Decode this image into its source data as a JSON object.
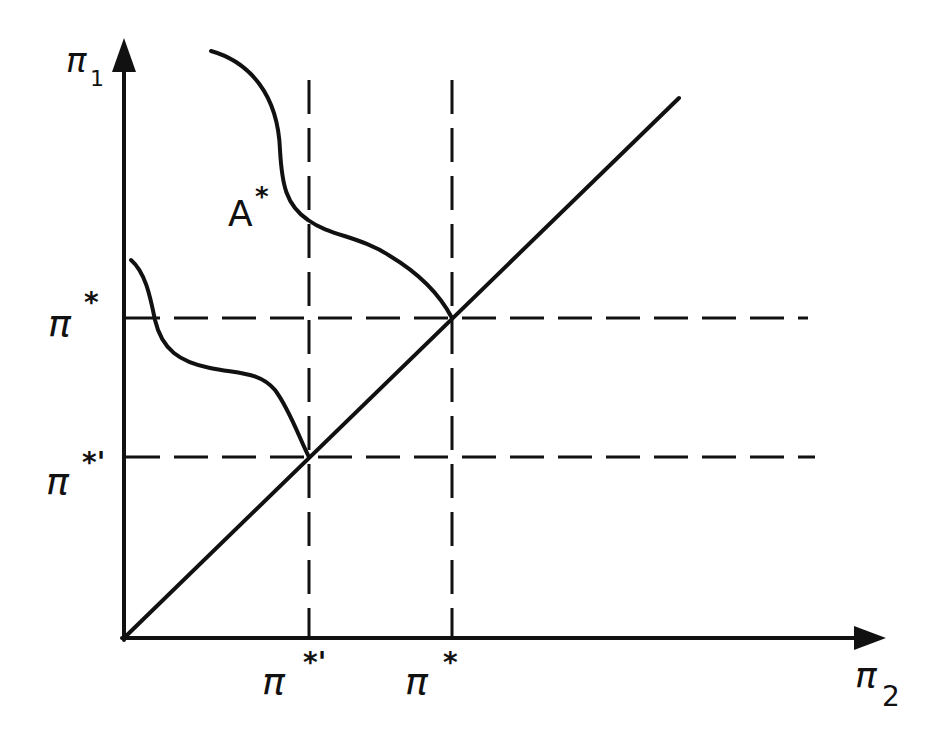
{
  "diagram": {
    "colors": {
      "ink": "#111111",
      "background": "#ffffff"
    },
    "axes": {
      "x": {
        "symbol": "π",
        "subscript": "2"
      },
      "y": {
        "symbol": "π",
        "subscript": "1"
      }
    },
    "x_ticks": [
      {
        "symbol": "π",
        "superscript": "*'",
        "position": "pi_star_prime"
      },
      {
        "symbol": "π",
        "superscript": "*",
        "position": "pi_star"
      }
    ],
    "y_ticks": [
      {
        "symbol": "π",
        "superscript": "*",
        "position": "pi_star"
      },
      {
        "symbol": "π",
        "superscript": "*'",
        "position": "pi_star_prime"
      }
    ],
    "curves": [
      {
        "name": "A*",
        "label_symbol": "A",
        "label_superscript": "*",
        "meets_diagonal_at": "(π*, π*)"
      },
      {
        "name": "lower-curve",
        "meets_diagonal_at": "(π*', π*')"
      }
    ],
    "lines": {
      "diagonal": "45-degree line π1 = π2",
      "dashed_horizontal": [
        "π1 = π*",
        "π1 = π*'"
      ],
      "dashed_vertical": [
        "π2 = π*'",
        "π2 = π*"
      ]
    }
  }
}
